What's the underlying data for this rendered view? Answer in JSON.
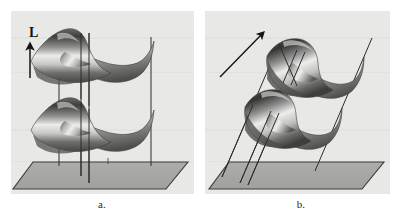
{
  "figure": {
    "type": "technical-illustration",
    "background_color": "#ffffff",
    "panel_background_color": "#e8e8e6",
    "ground_plane_color": "#a8a8a8",
    "ground_plane_edge_color": "#3a3a3a",
    "line_color": "#2d2d2d",
    "surface_light_color": "#f2f2f0",
    "surface_mid_color": "#9a9a98",
    "surface_dark_color": "#3c3c3a"
  },
  "panels": [
    {
      "id": "a",
      "caption": "a.",
      "vector_label": "L",
      "arrow_direction": "vertical-up",
      "line_orientation": "vertical",
      "surface_count": 2
    },
    {
      "id": "b",
      "caption": "b.",
      "vector_label": "L",
      "arrow_direction": "diagonal-up-right",
      "line_orientation": "slanted",
      "surface_count": 2
    }
  ]
}
